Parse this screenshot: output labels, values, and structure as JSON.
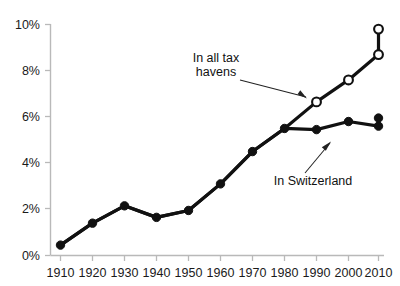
{
  "chart_data": {
    "type": "line",
    "title": "",
    "subtitle": "",
    "xlabel": "",
    "ylabel": "",
    "x": [
      1910,
      1920,
      1930,
      1940,
      1950,
      1960,
      1970,
      1980,
      1990,
      2000,
      2010,
      2013
    ],
    "xtick_labels": [
      "1910",
      "1920",
      "1930",
      "1940",
      "1950",
      "1960",
      "1970",
      "1980",
      "1990",
      "2000",
      "2010",
      "2013"
    ],
    "ytick_labels": [
      "0%",
      "2%",
      "4%",
      "6%",
      "8%",
      "10%"
    ],
    "ytick_values": [
      0,
      2,
      4,
      6,
      8,
      10
    ],
    "ylim": [
      0,
      10
    ],
    "xlim": [
      1910,
      2013
    ],
    "grid": false,
    "legend_position": "inline-annotations",
    "series": [
      {
        "name": "In all tax havens",
        "marker": "open-circle",
        "color": "#111111",
        "values": [
          0.45,
          1.4,
          2.15,
          1.65,
          1.95,
          3.1,
          4.5,
          5.5,
          6.65,
          7.6,
          8.7,
          9.8
        ]
      },
      {
        "name": "In Switzerland",
        "marker": "filled-circle",
        "color": "#111111",
        "values": [
          0.45,
          1.4,
          2.15,
          1.65,
          1.95,
          3.1,
          4.5,
          5.5,
          5.45,
          5.8,
          5.6,
          5.95
        ]
      }
    ],
    "annotations": [
      {
        "id": "tax-havens",
        "line1": "In all tax havens",
        "line2": "",
        "text_lines": [
          "In all tax",
          "havens"
        ],
        "points_to_x": 1990,
        "points_to_y": 6.65
      },
      {
        "id": "switzerland",
        "line1": "In Switzerland",
        "line2": "",
        "text_lines": [
          "In Switzerland"
        ],
        "points_to_x": 2000,
        "points_to_y": 5.8
      }
    ]
  },
  "axis": {
    "y_axis_name": "percent-axis",
    "x_axis_name": "year-axis"
  }
}
